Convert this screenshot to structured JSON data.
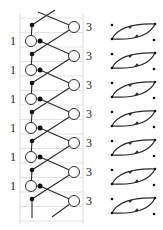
{
  "figure": {
    "left_diagram": {
      "row_count": 7,
      "row_spacing": 29,
      "left_label": "1",
      "right_label": "3",
      "left_label_count": 6,
      "right_label_count": 7
    },
    "right_diagram": {
      "row_count": 7,
      "element": "lens-cycle-with-two-arrows"
    },
    "colors": {
      "line": "#2a2a2a",
      "dot": "#111111",
      "grid": "#dcdcdc",
      "circle_fill": "#ffffff"
    }
  }
}
